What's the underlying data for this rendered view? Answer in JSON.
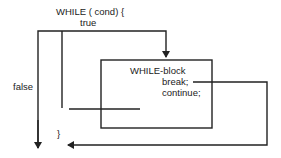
{
  "diagram": {
    "header_text": "WHILE ( cond) {",
    "true_label": "true",
    "false_label": "false",
    "block_label": "WHILE-block",
    "break_label": "break;",
    "continue_label": "continue;",
    "closing_brace": "}",
    "colors": {
      "line": "#222222",
      "background": "#ffffff"
    }
  }
}
